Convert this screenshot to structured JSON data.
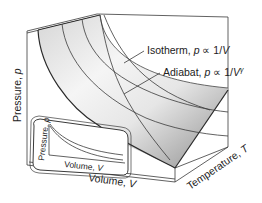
{
  "labels": {
    "isotherm": "Isotherm, p ∝ 1/V",
    "isotherm_parts": {
      "name": "Isotherm, ",
      "p": "p",
      "rel": " ∝ 1/",
      "v": "V"
    },
    "adiabat_parts": {
      "name": "Adiabat, ",
      "p": "p",
      "rel": " ∝ 1/",
      "v": "V",
      "exp": "γ"
    },
    "pressure_axis": {
      "name": "Pressure, ",
      "sym": "p"
    },
    "volume_axis": {
      "name": "Volume, ",
      "sym": "V"
    },
    "temperature_axis": {
      "name": "Temperature, ",
      "sym": "T"
    },
    "inset_pressure": {
      "name": "Pressure, ",
      "sym": "p"
    },
    "inset_volume": {
      "name": "Volume, ",
      "sym": "V"
    }
  },
  "colors": {
    "line": "#3a3a3a",
    "surface_light": "#f4f4f4",
    "surface_dark": "#8c8c8c",
    "background": "#ffffff"
  }
}
